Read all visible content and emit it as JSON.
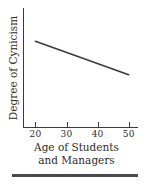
{
  "chart_data": {
    "type": "line",
    "title": "",
    "xlabel": "Age of Students and Managers",
    "xlabel_line1": "Age of Students",
    "xlabel_line2": "and Managers",
    "ylabel": "Degree of Cynicism",
    "xlim": [
      16,
      53
    ],
    "ylim": [
      0,
      1
    ],
    "xticks": [
      20,
      30,
      40,
      50
    ],
    "xtick_labels": [
      "20",
      "30",
      "40",
      "50"
    ],
    "yticks": [],
    "ytick_labels": [],
    "grid": false,
    "legend": null,
    "series": [
      {
        "name": "cynicism-trend",
        "x": [
          20,
          50
        ],
        "y": [
          0.72,
          0.44
        ],
        "color": "#3a3a3a",
        "linewidth": 1.6,
        "description": "Negative linear relationship: degree of cynicism decreases as age increases from 20 to 50."
      }
    ],
    "annotations": []
  },
  "figure": {
    "axis_color": "#3a3a3a",
    "text_color": "#2b2b2b",
    "background": "#ffffff",
    "rule_color": "#4a4a4a"
  }
}
